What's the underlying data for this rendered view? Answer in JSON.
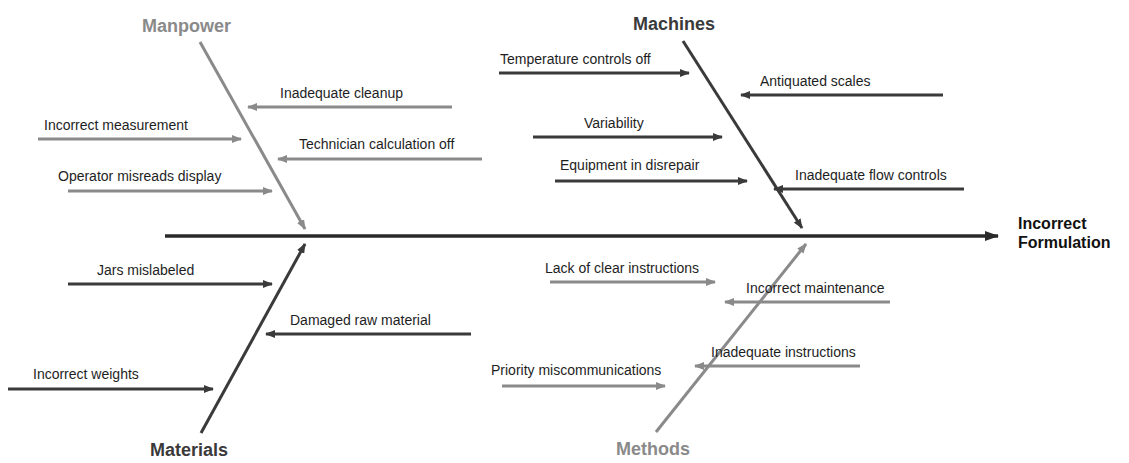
{
  "diagram": {
    "type": "fishbone",
    "effect": {
      "line1": "Incorrect",
      "line2": "Formulation"
    },
    "colors": {
      "dark": "#3a3a3a",
      "light": "#8a8a8a",
      "spine": "#2a2a2a"
    },
    "categories": {
      "manpower": {
        "label": "Manpower",
        "causes": [
          "Inadequate cleanup",
          "Incorrect measurement",
          "Technician calculation off",
          "Operator misreads display"
        ]
      },
      "machines": {
        "label": "Machines",
        "causes": [
          "Temperature controls off",
          "Antiquated scales",
          "Variability",
          "Equipment in disrepair",
          "Inadequate flow controls"
        ]
      },
      "materials": {
        "label": "Materials",
        "causes": [
          "Jars mislabeled",
          "Damaged raw material",
          "Incorrect weights"
        ]
      },
      "methods": {
        "label": "Methods",
        "causes": [
          "Lack of clear instructions",
          "Incorrect maintenance",
          "Inadequate instructions",
          "Priority miscommunications"
        ]
      }
    }
  }
}
